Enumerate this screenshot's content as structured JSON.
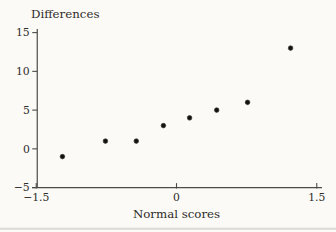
{
  "figure": {
    "kind": "normal-quantile-plot"
  },
  "chart_data": {
    "type": "scatter",
    "title": "",
    "xlabel": "Normal scores",
    "ylabel": "Differences",
    "x": [
      -1.22,
      -0.76,
      -0.43,
      -0.14,
      0.14,
      0.43,
      0.76,
      1.22
    ],
    "y": [
      -1,
      1,
      1,
      3,
      4,
      5,
      6,
      13
    ],
    "xlim": [
      -1.5,
      1.5
    ],
    "ylim": [
      -5,
      15
    ],
    "x_ticks": [
      -1.5,
      0,
      1.5
    ],
    "x_tick_labels": [
      "−1.5",
      "0",
      "1.5"
    ],
    "y_ticks": [
      15,
      10,
      5,
      0,
      -5
    ],
    "y_tick_labels": [
      "15",
      "10",
      "5",
      "0",
      "−5"
    ],
    "grid": false,
    "legend": "none",
    "point_color": "#141210",
    "axis_color": "#4d4b47",
    "text_color": "#2e2c28",
    "rule_color": "#d6d5d0",
    "background": "#fbfaf7"
  }
}
